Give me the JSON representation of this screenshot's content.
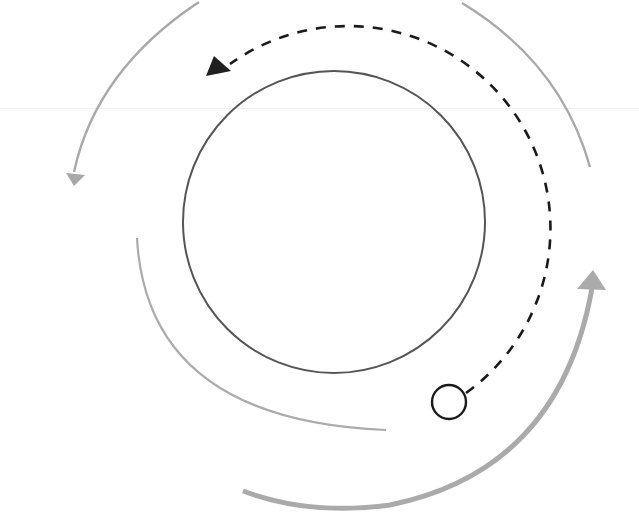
{
  "diagram": {
    "type": "orbital-motion-diagram",
    "labels": [],
    "colors": {
      "background": "#ffffff",
      "central_body_stroke": "#555555",
      "orbit_path_stroke": "#1a1a1a",
      "satellite_stroke": "#1a1a1a",
      "outer_arc_stroke": "#a8a8a8",
      "bottom_arc_stroke": "#aaaaaa",
      "faint_rule": "#f1f1f1"
    },
    "elements": [
      {
        "id": "central-body",
        "shape": "circle",
        "center": [
          334,
          222
        ],
        "radius": 152
      },
      {
        "id": "orbit-path",
        "shape": "dashed-arc",
        "direction": "counter-clockwise",
        "from": [
          466,
          394
        ],
        "to": [
          212,
          72
        ],
        "arrowhead": "end"
      },
      {
        "id": "satellite",
        "shape": "circle",
        "center": [
          449,
          402
        ],
        "radius": 17
      },
      {
        "id": "outer-arc-top-left",
        "shape": "arc",
        "from": [
          198,
          0
        ],
        "to": [
          74,
          180
        ],
        "arrowhead": "end"
      },
      {
        "id": "outer-arc-top-right",
        "shape": "arc",
        "from": [
          462,
          0
        ],
        "to": [
          590,
          167
        ],
        "arrowhead": "none"
      },
      {
        "id": "inner-arc-left",
        "shape": "arc",
        "from": [
          137,
          238
        ],
        "to": [
          386,
          430
        ],
        "arrowhead": "none"
      },
      {
        "id": "bottom-arc",
        "shape": "thick-arc",
        "from": [
          243,
          492
        ],
        "to": [
          593,
          275
        ],
        "arrowhead": "end"
      }
    ]
  }
}
